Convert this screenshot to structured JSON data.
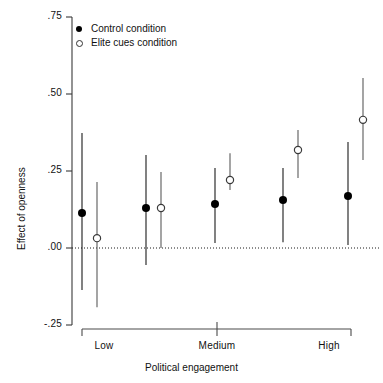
{
  "chart_data": {
    "type": "scatter",
    "title": "",
    "xlabel": "Political engagement",
    "ylabel": "Effect of openness",
    "ylim": [
      -0.25,
      0.75
    ],
    "yticks": [
      ".75",
      ".50",
      ".25",
      ".00",
      "-.25"
    ],
    "ytick_values": [
      0.75,
      0.5,
      0.25,
      0.0,
      -0.25
    ],
    "xticks": [
      "Low",
      "Medium",
      "High"
    ],
    "grid": false,
    "zero_reference_line": 0.0,
    "legend_position": "top-left",
    "legend": [
      {
        "label": "Control condition",
        "marker": "filled-circle",
        "color": "#000000"
      },
      {
        "label": "Elite cues condition",
        "marker": "open-circle",
        "color": "#333333"
      }
    ],
    "x_positions": [
      1,
      2,
      3,
      4,
      5
    ],
    "series": [
      {
        "name": "Control condition",
        "marker": "filled-circle",
        "values": [
          0.114,
          0.13,
          0.143,
          0.156,
          0.169
        ],
        "ci_low": [
          -0.136,
          -0.055,
          0.016,
          0.019,
          0.01
        ],
        "ci_high": [
          0.373,
          0.302,
          0.26,
          0.26,
          0.344
        ]
      },
      {
        "name": "Elite cues condition",
        "marker": "open-circle",
        "values": [
          0.032,
          0.13,
          0.221,
          0.318,
          0.416
        ],
        "ci_low": [
          -0.192,
          0.0,
          0.188,
          0.227,
          0.286
        ],
        "ci_high": [
          0.214,
          0.247,
          0.308,
          0.383,
          0.552
        ]
      }
    ]
  },
  "axes": {
    "ylabel": "Effect of openness",
    "xlabel": "Political engagement",
    "ytick_labels": [
      ".75",
      ".50",
      ".25",
      ".00",
      "-.25"
    ],
    "xtick_labels": [
      "Low",
      "Medium",
      "High"
    ]
  }
}
